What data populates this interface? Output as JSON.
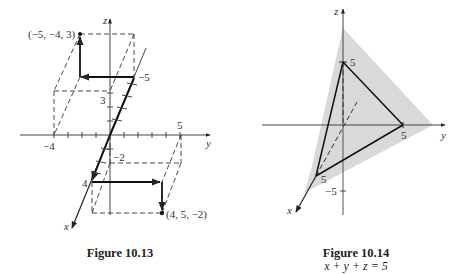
{
  "figures": [
    {
      "id": "fig-10-13",
      "caption": "Figure 10.13",
      "axes": {
        "x_label": "x",
        "y_label": "y",
        "z_label": "z"
      },
      "tick_labels": {
        "y_neg": "−4",
        "y_pos": "5",
        "z_pos": "3",
        "z_neg": "−2",
        "x_pos": "4",
        "x_neg": "−5"
      },
      "points": [
        {
          "label": "(−5, −4, 3)",
          "coords": [
            -5,
            -4,
            3
          ]
        },
        {
          "label": "(4, 5, −2)",
          "coords": [
            4,
            5,
            -2
          ]
        }
      ]
    },
    {
      "id": "fig-10-14",
      "caption": "Figure 10.14",
      "subcaption": "x + y + z = 5",
      "axes": {
        "x_label": "x",
        "y_label": "y",
        "z_label": "z"
      },
      "tick_labels": {
        "z_pos": "5",
        "y_pos": "5",
        "x_pos": "5",
        "z_neg": "−5"
      },
      "plane_color": "#d9d9d9",
      "intercepts": {
        "x": 5,
        "y": 5,
        "z": 5
      }
    }
  ]
}
